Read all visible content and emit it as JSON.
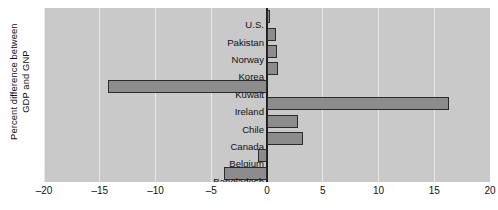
{
  "chart_data": {
    "type": "bar",
    "orientation": "horizontal",
    "title": "",
    "xlabel": "",
    "ylabel": "Percent difference between\nGDP and GNP",
    "xlim": [
      -20,
      20
    ],
    "xticks": [
      -20,
      -15,
      -10,
      -5,
      0,
      5,
      10,
      15,
      20
    ],
    "xticklabels": [
      "–20",
      "–15",
      "–10",
      "–5",
      "0",
      "5",
      "10",
      "15",
      "20"
    ],
    "grid": true,
    "legend": "none",
    "categories": [
      "U.S.",
      "Pakistan",
      "Norway",
      "Korea",
      "Kuwait",
      "Ireland",
      "Chile",
      "Canada",
      "Belgium",
      "Bangladesh"
    ],
    "values": [
      0.3,
      0.8,
      0.9,
      1.0,
      -14.3,
      16.3,
      2.8,
      3.2,
      -0.8,
      -3.9
    ],
    "colors": {
      "bar_fill": "#8c8c8c",
      "bar_edge": "#2b2b2b",
      "panel_background": "#c9c9c9",
      "gridline": "#e8e8e8",
      "zero_axis": "#1c1c1c",
      "text": "#111111",
      "figure_background": "#ffffff"
    }
  }
}
